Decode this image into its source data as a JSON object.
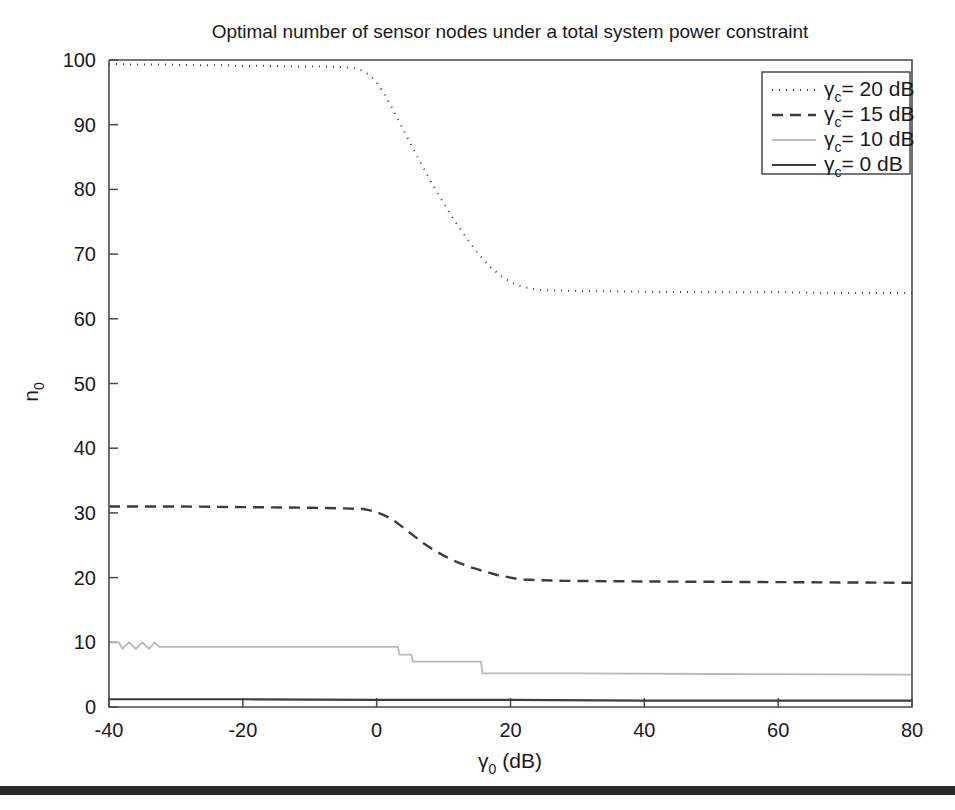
{
  "chart_data": {
    "type": "line",
    "title": "Optimal number of sensor nodes under a total system power constraint",
    "xlabel": "γ0 (dB)",
    "xlabel_base": "γ",
    "xlabel_sub": "0",
    "xlabel_unit": " (dB)",
    "ylabel_base": "n",
    "ylabel_sub": "0",
    "xlim": [
      -40,
      80
    ],
    "ylim": [
      0,
      100
    ],
    "xticks": [
      -40,
      -20,
      0,
      20,
      40,
      60,
      80
    ],
    "xticklabels": [
      "-40",
      "-20",
      "0",
      "20",
      "40",
      "60",
      "80"
    ],
    "yticks": [
      0,
      10,
      20,
      30,
      40,
      50,
      60,
      70,
      80,
      90,
      100
    ],
    "yticklabels": [
      "0",
      "10",
      "20",
      "30",
      "40",
      "50",
      "60",
      "70",
      "80",
      "90",
      "100"
    ],
    "grid": false,
    "legend_position": "upper right",
    "series": [
      {
        "name": "γc = 20 dB",
        "label_base": "γ",
        "label_sub": "c",
        "label_rest": "= 20 dB",
        "style": "dotted",
        "color": "#3d3d3d",
        "width": 2.0,
        "dash": "1,6",
        "points": [
          [
            -40,
            99.4
          ],
          [
            -36,
            99.3
          ],
          [
            -32,
            99.3
          ],
          [
            -28,
            99.2
          ],
          [
            -24,
            99.2
          ],
          [
            -20,
            99.1
          ],
          [
            -16,
            99.1
          ],
          [
            -12,
            99.0
          ],
          [
            -8,
            99.0
          ],
          [
            -5,
            98.9
          ],
          [
            -3,
            98.7
          ],
          [
            -2,
            98.3
          ],
          [
            -1,
            97.6
          ],
          [
            0,
            96.5
          ],
          [
            1,
            95.0
          ],
          [
            2,
            93.2
          ],
          [
            3,
            91.2
          ],
          [
            4,
            89.2
          ],
          [
            5,
            87.2
          ],
          [
            6,
            85.2
          ],
          [
            7,
            83.3
          ],
          [
            8,
            81.4
          ],
          [
            9,
            79.6
          ],
          [
            10,
            77.9
          ],
          [
            11,
            76.2
          ],
          [
            12,
            74.6
          ],
          [
            13,
            73.1
          ],
          [
            14,
            71.7
          ],
          [
            15,
            70.3
          ],
          [
            16,
            69.1
          ],
          [
            17,
            68.0
          ],
          [
            18,
            67.1
          ],
          [
            19,
            66.3
          ],
          [
            20,
            65.7
          ],
          [
            21,
            65.2
          ],
          [
            22,
            64.9
          ],
          [
            23,
            64.7
          ],
          [
            24,
            64.5
          ],
          [
            26,
            64.4
          ],
          [
            30,
            64.3
          ],
          [
            40,
            64.2
          ],
          [
            50,
            64.1
          ],
          [
            60,
            64.1
          ],
          [
            70,
            64.0
          ],
          [
            80,
            64.0
          ]
        ]
      },
      {
        "name": "γc = 15 dB",
        "label_base": "γ",
        "label_sub": "c",
        "label_rest": "= 15 dB",
        "style": "dashed",
        "color": "#3d3d3d",
        "width": 2.4,
        "dash": "11,7",
        "points": [
          [
            -40,
            31.0
          ],
          [
            -30,
            31.0
          ],
          [
            -20,
            30.9
          ],
          [
            -10,
            30.8
          ],
          [
            -5,
            30.7
          ],
          [
            -2,
            30.6
          ],
          [
            -1,
            30.4
          ],
          [
            0,
            30.1
          ],
          [
            1,
            29.7
          ],
          [
            2,
            29.2
          ],
          [
            3,
            28.5
          ],
          [
            4,
            27.7
          ],
          [
            5,
            26.9
          ],
          [
            6,
            26.1
          ],
          [
            7,
            25.3
          ],
          [
            8,
            24.6
          ],
          [
            9,
            24.0
          ],
          [
            10,
            23.4
          ],
          [
            11,
            22.9
          ],
          [
            12,
            22.4
          ],
          [
            13,
            22.0
          ],
          [
            14,
            21.6
          ],
          [
            15,
            21.3
          ],
          [
            16,
            21.0
          ],
          [
            17,
            20.7
          ],
          [
            18,
            20.4
          ],
          [
            19,
            20.2
          ],
          [
            20,
            20.0
          ],
          [
            21,
            19.8
          ],
          [
            22,
            19.7
          ],
          [
            24,
            19.6
          ],
          [
            28,
            19.5
          ],
          [
            40,
            19.4
          ],
          [
            60,
            19.3
          ],
          [
            80,
            19.2
          ]
        ]
      },
      {
        "name": "γc = 10 dB",
        "label_base": "γ",
        "label_sub": "c",
        "label_rest": "= 10 dB",
        "style": "solid",
        "color": "#b9b9b9",
        "width": 1.8,
        "dash": "none",
        "points": [
          [
            -40,
            10.0
          ],
          [
            -38.5,
            10.0
          ],
          [
            -38,
            9.0
          ],
          [
            -37,
            10.0
          ],
          [
            -36,
            9.0
          ],
          [
            -35,
            10.0
          ],
          [
            -34,
            9.0
          ],
          [
            -33.2,
            10.0
          ],
          [
            -32.5,
            9.3
          ],
          [
            -30,
            9.3
          ],
          [
            -10,
            9.3
          ],
          [
            2,
            9.3
          ],
          [
            3.2,
            9.3
          ],
          [
            3.4,
            8.1
          ],
          [
            5.2,
            8.1
          ],
          [
            5.4,
            7.0
          ],
          [
            15.6,
            7.0
          ],
          [
            15.8,
            5.2
          ],
          [
            30,
            5.2
          ],
          [
            50,
            5.1
          ],
          [
            80,
            5.0
          ]
        ]
      },
      {
        "name": "γc = 0 dB",
        "label_base": "γ",
        "label_sub": "c",
        "label_rest": "= 0 dB",
        "style": "solid",
        "color": "#3d3d3d",
        "width": 2.2,
        "dash": "none",
        "points": [
          [
            -40,
            1.2
          ],
          [
            -20,
            1.2
          ],
          [
            0,
            1.1
          ],
          [
            20,
            1.1
          ],
          [
            40,
            1.0
          ],
          [
            60,
            1.0
          ],
          [
            80,
            1.0
          ]
        ]
      }
    ]
  },
  "figure": {
    "background": "#ffffff",
    "axis_color": "#4a4a4a",
    "text_color": "#1a1a1a"
  }
}
